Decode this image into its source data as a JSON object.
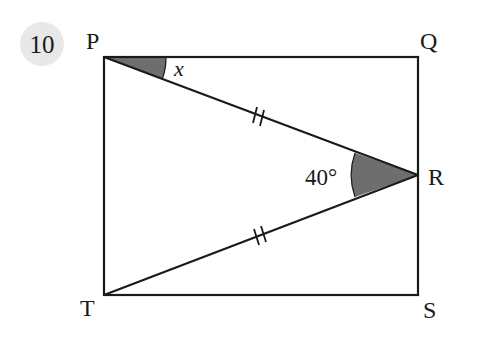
{
  "question": {
    "number": "10",
    "badge_color": "#e6e6e6"
  },
  "figure": {
    "vertices": {
      "P": {
        "label": "P",
        "x": 104,
        "y": 57
      },
      "Q": {
        "label": "Q",
        "x": 418,
        "y": 57
      },
      "R": {
        "label": "R",
        "x": 418,
        "y": 175
      },
      "S": {
        "label": "S",
        "x": 418,
        "y": 295
      },
      "T": {
        "label": "T",
        "x": 104,
        "y": 295
      }
    },
    "shape": "rectangle PQST with triangle PRT inside",
    "equal_sides": [
      "PR",
      "TR"
    ],
    "angles": {
      "x": {
        "label": "x",
        "at": "P",
        "between": [
          "PQ",
          "PR"
        ]
      },
      "R": {
        "label": "40°",
        "at": "R",
        "between": [
          "RP",
          "RT"
        ]
      }
    },
    "line_color": "#1a1a1a",
    "shade_color": "#6e6e6e"
  }
}
